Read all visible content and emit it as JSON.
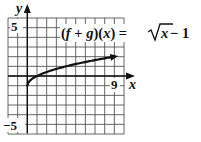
{
  "chart_data": {
    "type": "line",
    "xlabel": "x",
    "ylabel": "y",
    "xlim": [
      -2,
      10
    ],
    "ylim": [
      -6,
      6
    ],
    "grid": true,
    "tick_labels": {
      "x": [
        "9"
      ],
      "y": [
        "5",
        "−5"
      ]
    },
    "series": [
      {
        "name": "(f + g)(x) = √x − 1",
        "x": [
          0,
          0.25,
          1,
          2,
          4,
          6,
          9
        ],
        "y": [
          -1,
          -0.5,
          0,
          0.414,
          1,
          1.449,
          2
        ],
        "arrow_end": true
      }
    ],
    "annotations": [
      {
        "text": "(f + g)(x) = √x − 1",
        "position": "top-right"
      }
    ]
  },
  "labels": {
    "y_axis": "y",
    "x_axis": "x",
    "y_tick_top": "5",
    "y_tick_bottom": "−5",
    "x_tick": "9",
    "eq_lhs_open": "(",
    "eq_f": "f",
    "eq_plus": " + ",
    "eq_g": "g",
    "eq_mid": ")(",
    "eq_x": "x",
    "eq_close": ")",
    "eq_equals": " = ",
    "eq_radicand": "x",
    "eq_minus_one": " − 1"
  },
  "colors": {
    "grid": "#555555",
    "axis": "#111111",
    "curve": "#111111",
    "background": "#ffffff"
  }
}
